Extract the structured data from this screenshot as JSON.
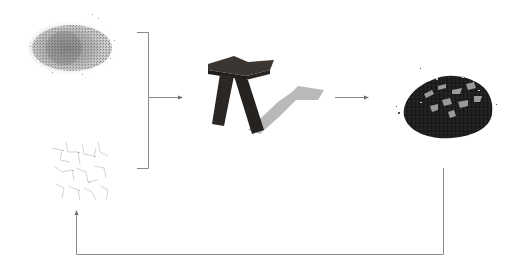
{
  "diagram": {
    "type": "process-cycle",
    "nodes": [
      {
        "id": "sawdust-pile",
        "kind": "image",
        "depicts": "pile of fine grey granular material (sawdust)"
      },
      {
        "id": "fiber-network",
        "kind": "image",
        "depicts": "faint sparse scattered fibers / binder"
      },
      {
        "id": "stool",
        "kind": "image",
        "depicts": "dark angular stool with cast shadow"
      },
      {
        "id": "shredded-pile",
        "kind": "image",
        "depicts": "pile of dark shredded material with light flecks"
      }
    ],
    "edges": [
      {
        "from": [
          "sawdust-pile",
          "fiber-network"
        ],
        "to": "stool",
        "style": "bracket-arrow"
      },
      {
        "from": "stool",
        "to": "shredded-pile",
        "style": "arrow"
      },
      {
        "from": "shredded-pile",
        "to": "fiber-network",
        "style": "return-loop-arrow"
      }
    ],
    "colors": {
      "background": "#ffffff",
      "line": "#8a8a8a",
      "stool": "#2b2724",
      "stool_shadow": "#b9b9b9",
      "sawdust": "#9a9a9a",
      "shredded": "#1e1e1e"
    }
  }
}
